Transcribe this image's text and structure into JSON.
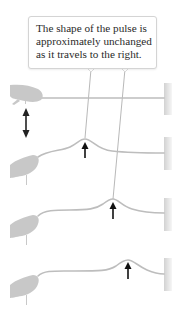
{
  "figure": {
    "callout": {
      "lines": [
        "The shape of the pulse is",
        "approximately unchanged",
        "as it travels to the right."
      ]
    },
    "colors": {
      "rope": "#bdbdbd",
      "hand": "#c8c8c8",
      "wall": "#dcdcdc",
      "arrow": "#111111",
      "leader": "#9a9a9a"
    },
    "rows": [
      {
        "label": "initial",
        "pulse_x": null,
        "motion": "up-down"
      },
      {
        "label": "pulse-1",
        "pulse_x": 85
      },
      {
        "label": "pulse-2",
        "pulse_x": 113
      },
      {
        "label": "pulse-3",
        "pulse_x": 128
      }
    ]
  }
}
